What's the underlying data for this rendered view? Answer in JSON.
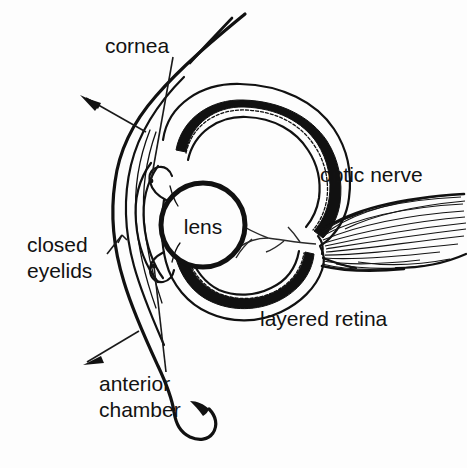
{
  "figure": {
    "background_color": "#fdfdfd",
    "ink_color": "#111111"
  },
  "labels": {
    "cornea": "cornea",
    "optic_nerve": "optic nerve",
    "lens": "lens",
    "closed_eyelids_line1": "closed",
    "closed_eyelids_line2": "eyelids",
    "layered_retina": "layered retina",
    "anterior_chamber_line1": "anterior",
    "anterior_chamber_line2": "chamber"
  },
  "structures": [
    {
      "name": "eyelids",
      "label": "closed eyelids",
      "description": "outer curved lid contour at left"
    },
    {
      "name": "cornea",
      "label": "cornea",
      "description": "curved transparent front dome"
    },
    {
      "name": "anterior-chamber",
      "label": "anterior chamber",
      "description": "space between cornea and lens"
    },
    {
      "name": "lens",
      "label": "lens",
      "description": "circular lens behind the iris"
    },
    {
      "name": "retina",
      "label": "layered retina",
      "description": "thick dark multi-layered posterior wall"
    },
    {
      "name": "optic-nerve",
      "label": "optic nerve",
      "description": "fanned fiber bundle exiting posteriorly"
    }
  ],
  "annotations": [
    {
      "name": "arrow-upper-left",
      "points_to": "cornea / lid surface",
      "direction": "up-left"
    },
    {
      "name": "arrow-lower-left",
      "points_to": "anterior chamber",
      "direction": "down-left"
    },
    {
      "name": "leader-cornea",
      "points_to": "cornea",
      "direction": "down"
    },
    {
      "name": "leader-eyelids",
      "points_to": "closed eyelids",
      "direction": "up-right"
    },
    {
      "name": "leader-anterior-chamber",
      "points_to": "anterior chamber",
      "direction": "up"
    }
  ]
}
